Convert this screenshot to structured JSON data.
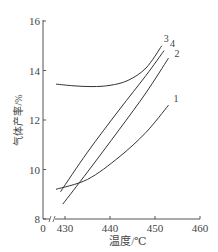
{
  "chart_data": {
    "type": "line",
    "title": "",
    "xlabel": "温度/℃",
    "ylabel": "气体产率/%",
    "xlim": [
      430,
      460
    ],
    "ylim": [
      8,
      16
    ],
    "x_ticks": [
      "0",
      "430",
      "440",
      "450",
      "460"
    ],
    "y_ticks": [
      "8",
      "10",
      "12",
      "14",
      "16"
    ],
    "axis_break": true,
    "grid": false,
    "legend": "inline numeric labels at curve ends",
    "series": [
      {
        "name": "1",
        "x": [
          428,
          435,
          442,
          448,
          453
        ],
        "values": [
          9.2,
          9.6,
          10.5,
          11.5,
          12.6
        ]
      },
      {
        "name": "2",
        "x": [
          429.5,
          435,
          442,
          448,
          453
        ],
        "values": [
          8.6,
          9.9,
          11.6,
          13.1,
          14.5
        ]
      },
      {
        "name": "3",
        "x": [
          428,
          432,
          436,
          440,
          444,
          448,
          451.5
        ],
        "values": [
          13.45,
          13.38,
          13.35,
          13.4,
          13.6,
          14.1,
          15.0
        ]
      },
      {
        "name": "4",
        "x": [
          429,
          435,
          442,
          448,
          452
        ],
        "values": [
          9.1,
          10.7,
          12.4,
          13.8,
          14.8
        ]
      }
    ],
    "colors": {
      "line": "#333333",
      "axis": "#555555",
      "text": "#444444"
    }
  }
}
